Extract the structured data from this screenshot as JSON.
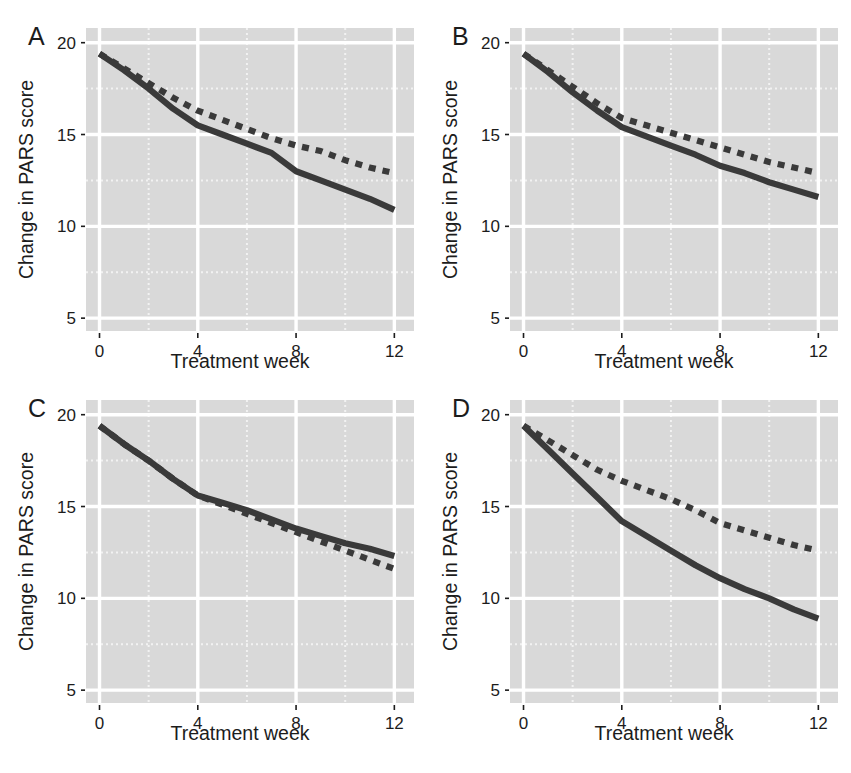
{
  "figure": {
    "panel_count": 4,
    "layout": "2x2 grid",
    "caption_partial": "Figure 1. Change in PARS score"
  },
  "axis": {
    "ylabel": "Change in PARS score",
    "xlabel": "Treatment week",
    "yticks": [
      "5",
      "10",
      "15",
      "20"
    ],
    "ytick_values": [
      5,
      10,
      15,
      20
    ],
    "xticks": [
      "0",
      "4",
      "8",
      "12"
    ],
    "xtick_values": [
      0,
      4,
      8,
      12
    ],
    "ylim": [
      4.3,
      20.8
    ],
    "xlim": [
      -0.55,
      12.8
    ]
  },
  "style": {
    "panel_background": "#d9d9d9",
    "major_gridline": "#ffffff",
    "minor_gridline": "#f2f2f2",
    "line_color": "#3a3a3a",
    "text_color": "#1c1c1c"
  },
  "panels": [
    {
      "letter": "A",
      "key": "a"
    },
    {
      "letter": "B",
      "key": "b"
    },
    {
      "letter": "C",
      "key": "c"
    },
    {
      "letter": "D",
      "key": "d"
    }
  ],
  "chart_data": [
    {
      "type": "line",
      "panel": "A",
      "title": "A",
      "xlabel": "Treatment week",
      "ylabel": "Change in PARS score",
      "xlim": [
        -0.55,
        12.8
      ],
      "ylim": [
        4.3,
        20.8
      ],
      "xticks": [
        0,
        4,
        8,
        12
      ],
      "yticks": [
        5,
        10,
        15,
        20
      ],
      "grid": true,
      "legend": "none",
      "x": [
        0,
        1,
        2,
        3,
        4,
        5,
        6,
        7,
        8,
        9,
        10,
        11,
        12
      ],
      "series": [
        {
          "name": "solid",
          "style": "solid",
          "values": [
            19.4,
            18.5,
            17.5,
            16.4,
            15.5,
            15.0,
            14.5,
            14.0,
            13.0,
            12.5,
            12.0,
            11.5,
            10.9
          ]
        },
        {
          "name": "dashed",
          "style": "dashed",
          "values": [
            19.4,
            18.6,
            17.8,
            17.0,
            16.3,
            15.8,
            15.3,
            14.8,
            14.4,
            14.1,
            13.6,
            13.2,
            12.9
          ]
        }
      ]
    },
    {
      "type": "line",
      "panel": "B",
      "title": "B",
      "xlabel": "Treatment week",
      "ylabel": "Change in PARS score",
      "xlim": [
        -0.55,
        12.8
      ],
      "ylim": [
        4.3,
        20.8
      ],
      "xticks": [
        0,
        4,
        8,
        12
      ],
      "yticks": [
        5,
        10,
        15,
        20
      ],
      "grid": true,
      "legend": "none",
      "x": [
        0,
        1,
        2,
        3,
        4,
        5,
        6,
        7,
        8,
        9,
        10,
        11,
        12
      ],
      "series": [
        {
          "name": "solid",
          "style": "solid",
          "values": [
            19.4,
            18.4,
            17.3,
            16.3,
            15.4,
            14.9,
            14.4,
            13.9,
            13.3,
            12.9,
            12.4,
            12.0,
            11.6
          ]
        },
        {
          "name": "dashed",
          "style": "dashed",
          "values": [
            19.4,
            18.5,
            17.6,
            16.7,
            15.9,
            15.5,
            15.1,
            14.7,
            14.3,
            13.9,
            13.5,
            13.2,
            12.9
          ]
        }
      ]
    },
    {
      "type": "line",
      "panel": "C",
      "title": "C",
      "xlabel": "Treatment week",
      "ylabel": "Change in PARS score",
      "xlim": [
        -0.55,
        12.8
      ],
      "ylim": [
        4.3,
        20.8
      ],
      "xticks": [
        0,
        4,
        8,
        12
      ],
      "yticks": [
        5,
        10,
        15,
        20
      ],
      "grid": true,
      "legend": "none",
      "x": [
        0,
        1,
        2,
        3,
        4,
        5,
        6,
        7,
        8,
        9,
        10,
        11,
        12
      ],
      "series": [
        {
          "name": "solid",
          "style": "solid",
          "values": [
            19.4,
            18.4,
            17.5,
            16.5,
            15.6,
            15.2,
            14.8,
            14.3,
            13.8,
            13.4,
            13.0,
            12.7,
            12.3
          ]
        },
        {
          "name": "dashed",
          "style": "dashed",
          "values": [
            19.4,
            18.4,
            17.5,
            16.5,
            15.6,
            15.1,
            14.6,
            14.1,
            13.6,
            13.1,
            12.6,
            12.1,
            11.6
          ]
        }
      ]
    },
    {
      "type": "line",
      "panel": "D",
      "title": "D",
      "xlabel": "Treatment week",
      "ylabel": "Change in PARS score",
      "xlim": [
        -0.55,
        12.8
      ],
      "ylim": [
        4.3,
        20.8
      ],
      "xticks": [
        0,
        4,
        8,
        12
      ],
      "yticks": [
        5,
        10,
        15,
        20
      ],
      "grid": true,
      "legend": "none",
      "x": [
        0,
        1,
        2,
        3,
        4,
        5,
        6,
        7,
        8,
        9,
        10,
        11,
        12
      ],
      "series": [
        {
          "name": "solid",
          "style": "solid",
          "values": [
            19.4,
            18.1,
            16.8,
            15.5,
            14.2,
            13.4,
            12.6,
            11.8,
            11.1,
            10.5,
            10.0,
            9.4,
            8.9
          ]
        },
        {
          "name": "dashed",
          "style": "dashed",
          "values": [
            19.4,
            18.6,
            17.8,
            17.0,
            16.4,
            15.9,
            15.4,
            14.8,
            14.1,
            13.7,
            13.3,
            12.9,
            12.6
          ]
        }
      ]
    }
  ]
}
